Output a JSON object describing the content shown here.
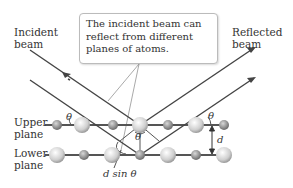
{
  "labels": {
    "incident_beam": "Incident\nbeam",
    "reflected_beam": "Reflected\nbeam",
    "upper_plane": "Upper\nplane",
    "lower_plane": "Lower\nplane",
    "callout": "The incident beam can reflect from different planes of atoms.",
    "theta": "θ",
    "d": "d",
    "dsin": "d sin θ"
  },
  "colors": {
    "beam": "#444444",
    "plane": "#555555",
    "atom_light": "#e6e6e6",
    "atom_dark": "#8a8a8a",
    "callout_line": "#aaaaaa"
  }
}
